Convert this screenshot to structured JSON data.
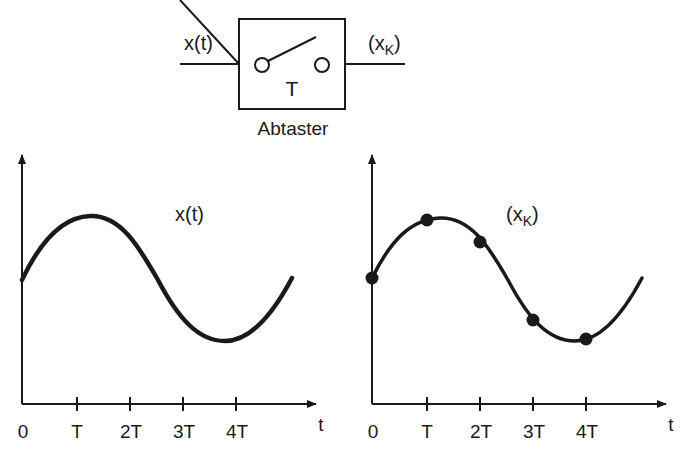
{
  "sampler": {
    "input_label": "x(t)",
    "output_label_main": "(x",
    "output_label_sub": "K",
    "output_label_close": ")",
    "period_label": "T",
    "caption": "Abtaster"
  },
  "left_plot": {
    "curve_label": "x(t)",
    "x_axis_label": "t",
    "ticks": [
      "0",
      "T",
      "2T",
      "3T",
      "4T"
    ]
  },
  "right_plot": {
    "curve_label_main": "(x",
    "curve_label_sub": "K",
    "curve_label_close": ")",
    "x_axis_label": "t",
    "ticks": [
      "0",
      "T",
      "2T",
      "3T",
      "4T"
    ]
  },
  "colors": {
    "ink": "#1a1a1a",
    "background": "#ffffff"
  }
}
